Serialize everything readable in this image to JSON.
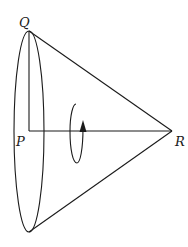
{
  "diagram": {
    "labels": {
      "q": "Q",
      "p": "P",
      "r": "R"
    },
    "elements": [
      "cone-base-ellipse",
      "slant-edge-QR",
      "slant-edge-bottom-R",
      "radius-QP",
      "axis-PR",
      "rotation-arrow"
    ],
    "stroke_color": "#1a1a1a",
    "background": "#ffffff"
  }
}
